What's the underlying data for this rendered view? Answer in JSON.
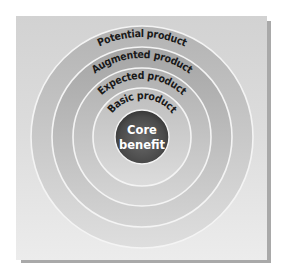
{
  "diagram": {
    "type": "concentric-circles",
    "center": {
      "x": 142,
      "y": 137
    },
    "rings": [
      {
        "label": "Potential product",
        "radius": 111,
        "color_top": "#b3b3b3",
        "color_bottom": "#dedede"
      },
      {
        "label": "Augmented product",
        "radius": 90,
        "color_top": "#a5a5a5",
        "color_bottom": "#d4d4d4"
      },
      {
        "label": "Expected product",
        "radius": 69,
        "color_top": "#b0b0b0",
        "color_bottom": "#d6d6d6"
      },
      {
        "label": "Basic product",
        "radius": 49,
        "color_top": "#bdbdbd",
        "color_bottom": "#dcdcdc"
      }
    ],
    "core": {
      "line1": "Core",
      "line2": "benefit",
      "radius": 27,
      "color_center": "#5e5e5e",
      "color_edge": "#333333"
    },
    "ring_divider_color": "#f4f4f4",
    "panel_color": "#dcdcdc"
  }
}
